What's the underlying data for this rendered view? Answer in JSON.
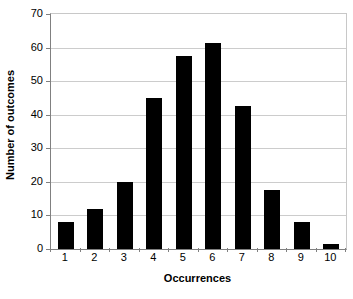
{
  "chart_data": {
    "type": "bar",
    "title": "",
    "xlabel": "Occurrences",
    "ylabel": "Number of outcomes",
    "categories": [
      "1",
      "2",
      "3",
      "4",
      "5",
      "6",
      "7",
      "8",
      "9",
      "10"
    ],
    "values": [
      8,
      12,
      20,
      45,
      57.5,
      61.5,
      42.5,
      17.5,
      8,
      1.5
    ],
    "series": [
      {
        "name": "Number of outcomes",
        "values": [
          8,
          12,
          20,
          45,
          57.5,
          61.5,
          42.5,
          17.5,
          8,
          1.5
        ]
      }
    ],
    "ylim": [
      0,
      70
    ],
    "yticks": [
      0,
      10,
      20,
      30,
      40,
      50,
      60,
      70
    ],
    "ytick_labels": [
      "0",
      "10",
      "20",
      "30",
      "40",
      "50",
      "60",
      "70"
    ],
    "xtick_labels": [
      "1",
      "2",
      "3",
      "4",
      "5",
      "6",
      "7",
      "8",
      "9",
      "10"
    ],
    "grid": "horizontal",
    "legend": "none",
    "bar_color": "#000000",
    "gridline_color": "#cccccc",
    "axis_color": "#808080",
    "background_color": "#ffffff"
  }
}
